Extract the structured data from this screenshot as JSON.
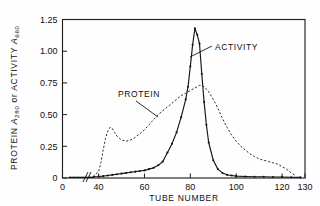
{
  "figure": {
    "background_color": "#fefefe",
    "ink_color": "#151515"
  },
  "axes": {
    "x_title": "TUBE  NUMBER",
    "y_title_parts": {
      "prefix": "PROTEIN ",
      "symbol1": "A",
      "sub1": "280",
      "conj": " or ",
      "symbol2": "ACTIVITY ",
      "symbol3": "A",
      "sub2": "660"
    },
    "x_ticks": [
      0,
      40,
      60,
      80,
      100,
      120,
      130
    ],
    "x_tick_labels": [
      "0",
      "40",
      "60",
      "80",
      "100",
      "120",
      "130"
    ],
    "y_ticks": [
      0,
      0.25,
      0.5,
      0.75,
      1.0,
      1.25
    ],
    "y_tick_labels": [
      "0",
      "0.25",
      "0.50",
      "0.75",
      "1.00",
      "1.25"
    ],
    "x_axis_break": true,
    "x_break_between": [
      5,
      38
    ],
    "xlim": [
      0,
      130
    ],
    "ylim": [
      0,
      1.25
    ],
    "grid": false
  },
  "annotations": [
    {
      "name": "protein-label",
      "text": "PROTEIN",
      "x": 118,
      "y": 94
    },
    {
      "name": "activity-label",
      "text": "ACTIVITY",
      "x": 215,
      "y": 47
    }
  ],
  "chart_data": {
    "type": "line",
    "title": "",
    "xlabel": "TUBE NUMBER",
    "ylabel": "PROTEIN A280 or ACTIVITY A660",
    "xlim": [
      0,
      130
    ],
    "ylim": [
      0,
      1.25
    ],
    "grid": false,
    "legend_position": "inline-annotations",
    "series": [
      {
        "name": "ACTIVITY",
        "style": "solid-with-markers",
        "y_quantity": "A660",
        "x": [
          2,
          6,
          10,
          14,
          18,
          22,
          26,
          30,
          34,
          38,
          40,
          42,
          44,
          46,
          48,
          50,
          52,
          54,
          56,
          58,
          60,
          62,
          64,
          66,
          68,
          70,
          72,
          74,
          76,
          78,
          79,
          80,
          81,
          82,
          83,
          84,
          85,
          86,
          87,
          88,
          90,
          92,
          94,
          96,
          98,
          100,
          104,
          108,
          112,
          116,
          120,
          124,
          128
        ],
        "y": [
          0.005,
          0.005,
          0.005,
          0.005,
          0.005,
          0.005,
          0.005,
          0.005,
          0.005,
          0.01,
          0.012,
          0.015,
          0.02,
          0.025,
          0.03,
          0.035,
          0.04,
          0.045,
          0.05,
          0.055,
          0.06,
          0.07,
          0.08,
          0.1,
          0.13,
          0.2,
          0.27,
          0.36,
          0.48,
          0.62,
          0.72,
          0.88,
          1.05,
          1.18,
          1.13,
          1.06,
          0.82,
          0.6,
          0.42,
          0.28,
          0.14,
          0.07,
          0.04,
          0.025,
          0.02,
          0.015,
          0.012,
          0.01,
          0.01,
          0.008,
          0.008,
          0.006,
          0.005
        ]
      },
      {
        "name": "PROTEIN",
        "style": "dashed",
        "y_quantity": "A280",
        "x": [
          2,
          8,
          14,
          20,
          26,
          32,
          36,
          38,
          40,
          41,
          42,
          43,
          44,
          45,
          46,
          47,
          48,
          50,
          52,
          54,
          56,
          58,
          60,
          62,
          64,
          66,
          68,
          70,
          72,
          74,
          76,
          78,
          80,
          82,
          84,
          85,
          86,
          88,
          90,
          92,
          94,
          96,
          98,
          100,
          102,
          104,
          106,
          108,
          110,
          112,
          114,
          116,
          118,
          120,
          122,
          124,
          126
        ],
        "y": [
          0.005,
          0.005,
          0.005,
          0.005,
          0.005,
          0.008,
          0.01,
          0.02,
          0.05,
          0.12,
          0.22,
          0.31,
          0.37,
          0.4,
          0.39,
          0.36,
          0.33,
          0.3,
          0.29,
          0.3,
          0.32,
          0.35,
          0.38,
          0.42,
          0.46,
          0.5,
          0.53,
          0.56,
          0.59,
          0.62,
          0.65,
          0.67,
          0.69,
          0.71,
          0.73,
          0.73,
          0.72,
          0.68,
          0.62,
          0.55,
          0.47,
          0.4,
          0.34,
          0.29,
          0.25,
          0.22,
          0.19,
          0.17,
          0.15,
          0.14,
          0.13,
          0.12,
          0.11,
          0.09,
          0.07,
          0.04,
          0.02
        ]
      }
    ]
  }
}
